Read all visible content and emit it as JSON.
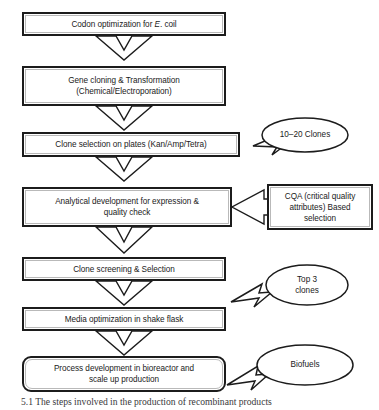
{
  "figure": {
    "type": "flowchart",
    "title": "Steps involved in the production of recombinant products",
    "orientation": "top-to-bottom",
    "caption": "5.1  The steps involved in the production of recombinant products"
  },
  "colors": {
    "stroke": "#1c1c1c",
    "inner_stroke": "#b9b9b9",
    "fill": "#ffffff",
    "text": "#1a1a1a",
    "caption_text": "#39393b"
  },
  "steps": [
    {
      "id": "step-1",
      "label_pre": "Codon optimization for ",
      "label_italic": "E",
      "label_post": ". coil",
      "label": "Codon optimization for E. coil"
    },
    {
      "id": "step-2",
      "label": "Gene cloning & Transformation\n(Chemical/Electroporation)"
    },
    {
      "id": "step-3",
      "label": "Clone selection on plates (Kan/Amp/Tetra)"
    },
    {
      "id": "step-4",
      "label": "Analytical development for expression &\nquality check"
    },
    {
      "id": "step-5",
      "label": "Clone screening & Selection"
    },
    {
      "id": "step-6",
      "label": "Media optimization in shake flask"
    },
    {
      "id": "step-7",
      "label": "Process development in bioreactor and\nscale up production"
    }
  ],
  "side_box": {
    "id": "cqa-box",
    "label": "CQA (critical quality\nattributes) Based\nselection"
  },
  "callouts": [
    {
      "id": "callout-clones",
      "label": "10–20 Clones"
    },
    {
      "id": "callout-top3",
      "label": "Top 3\nclones"
    },
    {
      "id": "callout-biofuels",
      "label": "Biofuels"
    }
  ],
  "connectors": [
    {
      "from": "step-1",
      "to": "step-2",
      "shape": "chevron-down"
    },
    {
      "from": "step-2",
      "to": "step-3",
      "shape": "chevron-down"
    },
    {
      "from": "step-3",
      "to": "step-4",
      "shape": "chevron-down"
    },
    {
      "from": "step-4",
      "to": "step-5",
      "shape": "chevron-down"
    },
    {
      "from": "step-5",
      "to": "step-6",
      "shape": "chevron-down"
    },
    {
      "from": "step-6",
      "to": "step-7",
      "shape": "chevron-down"
    },
    {
      "from": "cqa-box",
      "to": "step-4",
      "shape": "block-arrow-left"
    }
  ]
}
